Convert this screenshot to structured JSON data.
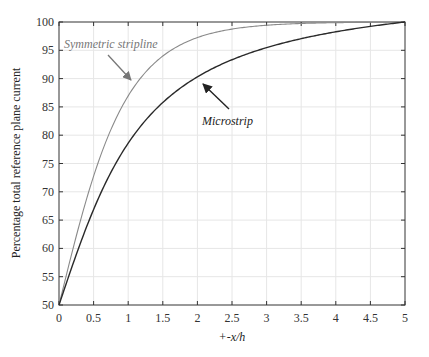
{
  "chart_data": {
    "type": "line",
    "title": "",
    "xlabel": "+-x/h",
    "ylabel": "Percentage total reference plane current",
    "xlim": [
      0,
      5
    ],
    "ylim": [
      50,
      100
    ],
    "grid": true,
    "legend": "none (inline annotations with arrows)",
    "x_ticks": [
      "0",
      "0.5",
      "1",
      "1.5",
      "2",
      "2.5",
      "3",
      "3.5",
      "4",
      "4.5",
      "5"
    ],
    "y_ticks": [
      "50",
      "55",
      "60",
      "65",
      "70",
      "75",
      "80",
      "85",
      "90",
      "95",
      "100"
    ],
    "x": [
      0,
      0.25,
      0.5,
      0.75,
      1,
      1.25,
      1.5,
      1.75,
      2,
      2.5,
      3,
      3.5,
      4,
      4.5,
      5
    ],
    "series": [
      {
        "name": "Symmetric stripline",
        "color": "#8a8a8a",
        "values": [
          50,
          62.5,
          72.8,
          80.9,
          87.0,
          91.2,
          94.0,
          96.0,
          97.3,
          98.8,
          99.5,
          99.8,
          99.9,
          100,
          100
        ]
      },
      {
        "name": "Microstrip",
        "color": "#2a2a2a",
        "values": [
          50,
          58.9,
          66.9,
          73.6,
          78.6,
          82.5,
          85.8,
          88.3,
          90.3,
          92.9,
          94.9,
          96.7,
          98.0,
          99.1,
          100
        ]
      }
    ],
    "annotations": [
      {
        "text": "Symmetric stripline",
        "arrow_to_x": 1.1,
        "arrow_to_y": 89.5
      },
      {
        "text": "Microstrip",
        "arrow_to_x": 2.0,
        "arrow_to_y": 89.5
      }
    ]
  }
}
